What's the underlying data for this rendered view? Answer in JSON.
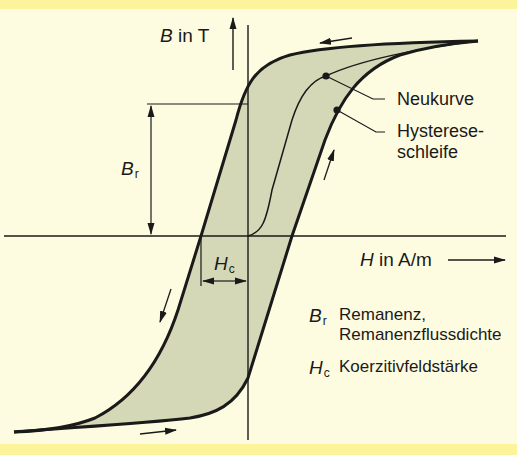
{
  "diagram": {
    "type": "hysteresis-loop",
    "colors": {
      "background": "#fefce0",
      "band": "#fbf49a",
      "loop_fill": "#d4d8b6",
      "line": "#1a1a1a"
    },
    "axes": {
      "y_label_symbol": "B",
      "y_label_unit": "in T",
      "x_label_symbol": "H",
      "x_label_unit": "in A/m"
    },
    "annotations": {
      "remanence_symbol": "B",
      "remanence_sub": "r",
      "coercivity_symbol": "H",
      "coercivity_sub": "c"
    },
    "callouts": {
      "new_curve": "Neukurve",
      "loop_line1": "Hysterese-",
      "loop_line2": "schleife"
    },
    "legend": [
      {
        "symbol": "B",
        "sub": "r",
        "line1": "Remanenz,",
        "line2": "Remanenzflussdichte"
      },
      {
        "symbol": "H",
        "sub": "c",
        "line1": "Koerzitivfeldstärke",
        "line2": ""
      }
    ]
  }
}
